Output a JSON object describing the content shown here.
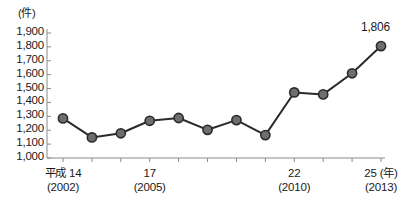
{
  "chart_data": {
    "type": "line",
    "title": "",
    "unit_label": "(件)",
    "xlabel": "(年)",
    "ylabel": "",
    "ylim": [
      1000,
      1900
    ],
    "ytick_step": 100,
    "grid": false,
    "legend": "none",
    "categories": [
      "2002",
      "2003",
      "2004",
      "2005",
      "2006",
      "2007",
      "2008",
      "2009",
      "2010",
      "2011",
      "2012",
      "2013"
    ],
    "values": [
      1285,
      1148,
      1178,
      1268,
      1288,
      1203,
      1273,
      1165,
      1472,
      1458,
      1610,
      1806
    ],
    "ytick_labels": [
      "1,900",
      "1,800",
      "1,700",
      "1,600",
      "1,500",
      "1,400",
      "1,300",
      "1,200",
      "1,100",
      "1,000"
    ],
    "ytick_values": [
      1900,
      1800,
      1700,
      1600,
      1500,
      1400,
      1300,
      1200,
      1100,
      1000
    ],
    "xtick_labels": [
      {
        "index": 0,
        "era": "平成 14",
        "year": "(2002)"
      },
      {
        "index": 3,
        "era": "17",
        "year": "(2005)"
      },
      {
        "index": 8,
        "era": "22",
        "year": "(2010)"
      },
      {
        "index": 11,
        "era": "25",
        "year": "(2013)"
      }
    ],
    "annotations": [
      {
        "index": 11,
        "text": "1,806",
        "value": 1806
      }
    ],
    "colors": {
      "line": "#2b2b2b",
      "marker_fill": "#6e6e6e",
      "marker_stroke": "#2b2b2b",
      "axis": "#8a8a8a",
      "text": "#1a1a1a"
    }
  }
}
